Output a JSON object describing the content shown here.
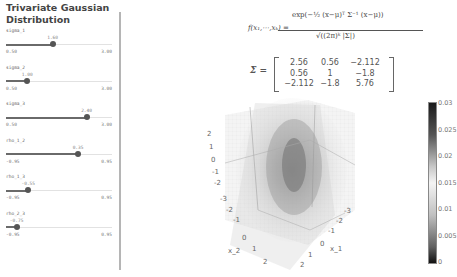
{
  "sidebar": {
    "title": "Trivariate Gaussian Distribution",
    "sliders": [
      {
        "name": "sigma_1",
        "value": "1.60",
        "min": "0.50",
        "max": "3.00",
        "pct": 44
      },
      {
        "name": "sigma_2",
        "value": "1.00",
        "min": "0.50",
        "max": "3.00",
        "pct": 20
      },
      {
        "name": "sigma_3",
        "value": "2.40",
        "min": "0.50",
        "max": "3.00",
        "pct": 76
      },
      {
        "name": "rho_1_2",
        "value": "0.35",
        "min": "-0.95",
        "max": "0.95",
        "pct": 68
      },
      {
        "name": "rho_1_3",
        "value": "-0.55",
        "min": "-0.95",
        "max": "0.95",
        "pct": 21
      },
      {
        "name": "rho_2_3",
        "value": "-0.75",
        "min": "-0.95",
        "max": "0.95",
        "pct": 10
      }
    ]
  },
  "formula": {
    "lhs": "f(x₁,⋯,xₖ) =",
    "numerator": "exp(−½ (x−μ)ᵀ Σ⁻¹ (x−μ))",
    "denominator": "√((2π)ᵏ |Σ|)"
  },
  "matrix": {
    "label": "Σ =",
    "rows": [
      [
        "2.56",
        "0.56",
        "−2.112"
      ],
      [
        "0.56",
        "1",
        "−1.8"
      ],
      [
        "−2.112",
        "−1.8",
        "5.76"
      ]
    ]
  },
  "plot": {
    "x1_label": "x_1",
    "x2_label": "x_2",
    "x1_ticks": [
      "2",
      "1",
      "0",
      "-1",
      "-2",
      "-3"
    ],
    "x2_ticks": [
      "-3",
      "-2",
      "-1",
      "0",
      "1",
      "2"
    ],
    "z_ticks": [
      "2",
      "1",
      "0",
      "-1",
      "-2"
    ],
    "colorbar_ticks": [
      "0.03",
      "0.025",
      "0.02",
      "0.015",
      "0.01",
      "0.005",
      "0"
    ]
  }
}
